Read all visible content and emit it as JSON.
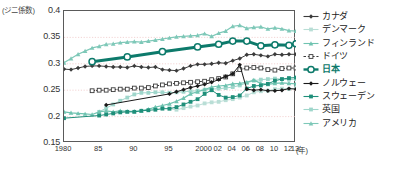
{
  "axis": {
    "y_unit_label": "(ジニ係数)",
    "y_ticks": [
      "0.4",
      "0.35",
      "0.3",
      "0.25",
      "0.2",
      "0.15"
    ],
    "x_ticks": [
      "1980",
      "85",
      "90",
      "95",
      "2000",
      "02",
      "04",
      "06",
      "08",
      "10",
      "12",
      "13"
    ],
    "x_unit_label": "(年)"
  },
  "legend": {
    "items": [
      {
        "label": "カナダ",
        "color": "#3b3b3b",
        "marker": "diamond",
        "key": "canada"
      },
      {
        "label": "デンマーク",
        "color": "#b9ded6",
        "marker": "square",
        "key": "denmark"
      },
      {
        "label": "フィンランド",
        "color": "#6fc3b0",
        "marker": "triangle",
        "key": "finland"
      },
      {
        "label": "ドイツ",
        "color": "#3b3b3b",
        "marker": "open-square",
        "key": "germany"
      },
      {
        "label": "日本",
        "color": "#0d7a6b",
        "marker": "open-circle",
        "key": "japan"
      },
      {
        "label": "ノルウェー",
        "color": "#1a1a1a",
        "marker": "diamond",
        "key": "norway"
      },
      {
        "label": "スウェーデン",
        "color": "#1f8f7a",
        "marker": "square",
        "key": "sweden"
      },
      {
        "label": "英国",
        "color": "#9fd6cb",
        "marker": "square",
        "key": "uk"
      },
      {
        "label": "アメリカ",
        "color": "#7ec8b8",
        "marker": "triangle",
        "key": "usa"
      }
    ]
  },
  "chart_data": {
    "type": "line",
    "title": "",
    "xlabel": "(年)",
    "ylabel": "(ジニ係数)",
    "ylim": [
      0.15,
      0.4
    ],
    "xlim": [
      1980,
      2013
    ],
    "grid": true,
    "grid_color": "#f0c9c9",
    "legend_position": "right",
    "x": [
      1980,
      1981,
      1982,
      1983,
      1984,
      1985,
      1986,
      1987,
      1988,
      1989,
      1990,
      1991,
      1992,
      1993,
      1994,
      1995,
      1996,
      1997,
      1998,
      1999,
      2000,
      2001,
      2002,
      2003,
      2004,
      2005,
      2006,
      2007,
      2008,
      2009,
      2010,
      2011,
      2012,
      2013
    ],
    "series": [
      {
        "name": "カナダ",
        "color": "#3b3b3b",
        "marker": "diamond",
        "width": 1,
        "values": [
          0.29,
          0.289,
          0.292,
          0.295,
          0.296,
          0.296,
          0.295,
          0.294,
          0.294,
          0.293,
          0.296,
          0.294,
          0.293,
          0.294,
          0.289,
          0.288,
          0.287,
          0.291,
          0.296,
          0.299,
          0.299,
          0.3,
          0.302,
          0.301,
          0.306,
          0.31,
          0.317,
          0.318,
          0.316,
          0.314,
          0.318,
          0.317,
          0.318,
          0.318
        ]
      },
      {
        "name": "デンマーク",
        "color": "#b9ded6",
        "marker": "square",
        "width": 1,
        "values": [
          null,
          null,
          null,
          null,
          null,
          null,
          null,
          null,
          null,
          null,
          null,
          null,
          null,
          null,
          null,
          0.215,
          0.213,
          0.216,
          0.219,
          0.221,
          0.225,
          0.227,
          0.228,
          0.231,
          0.233,
          0.236,
          0.24,
          0.246,
          0.248,
          0.249,
          0.252,
          0.253,
          0.252,
          0.254
        ]
      },
      {
        "name": "フィンランド",
        "color": "#6fc3b0",
        "marker": "triangle",
        "width": 1.2,
        "values": [
          0.209,
          0.207,
          0.206,
          0.205,
          0.204,
          0.209,
          0.211,
          0.209,
          0.211,
          0.21,
          0.21,
          0.211,
          0.214,
          0.218,
          0.221,
          0.224,
          0.229,
          0.235,
          0.243,
          0.247,
          0.251,
          0.256,
          0.258,
          0.259,
          0.262,
          0.263,
          0.265,
          0.269,
          0.263,
          0.261,
          0.263,
          0.264,
          0.263,
          0.262
        ]
      },
      {
        "name": "ドイツ",
        "color": "#3b3b3b",
        "marker": "open-square",
        "width": 1,
        "values": [
          null,
          null,
          null,
          null,
          0.249,
          0.25,
          0.25,
          0.251,
          0.252,
          0.252,
          0.254,
          0.254,
          0.255,
          0.258,
          0.26,
          0.262,
          0.263,
          0.264,
          0.265,
          0.266,
          0.267,
          0.27,
          0.272,
          0.275,
          0.281,
          0.289,
          0.292,
          0.293,
          0.292,
          0.289,
          0.288,
          0.291,
          0.292,
          0.292
        ]
      },
      {
        "name": "日本",
        "color": "#0d7a6b",
        "marker": "open-circle",
        "width": 3,
        "values": [
          null,
          null,
          null,
          null,
          0.304,
          null,
          null,
          null,
          null,
          0.313,
          null,
          null,
          null,
          null,
          0.323,
          null,
          null,
          null,
          null,
          0.332,
          null,
          null,
          0.337,
          null,
          0.343,
          null,
          0.343,
          null,
          0.334,
          null,
          0.336,
          null,
          0.335,
          0.338
        ]
      },
      {
        "name": "ノルウェー",
        "color": "#1a1a1a",
        "marker": "diamond",
        "width": 1,
        "values": [
          null,
          null,
          null,
          null,
          null,
          null,
          0.222,
          null,
          null,
          null,
          null,
          null,
          null,
          null,
          null,
          0.243,
          0.247,
          0.251,
          0.255,
          0.258,
          0.261,
          0.265,
          0.27,
          0.276,
          0.281,
          0.298,
          0.252,
          0.25,
          0.251,
          0.249,
          0.249,
          0.25,
          0.253,
          0.252
        ]
      },
      {
        "name": "スウェーデン",
        "color": "#1f8f7a",
        "marker": "square",
        "width": 1,
        "values": [
          0.197,
          null,
          null,
          null,
          null,
          0.202,
          0.204,
          0.206,
          0.208,
          0.209,
          0.209,
          0.211,
          0.212,
          0.213,
          0.215,
          0.215,
          0.218,
          0.223,
          0.228,
          0.233,
          0.243,
          0.25,
          0.241,
          0.236,
          0.237,
          0.24,
          0.253,
          0.258,
          0.259,
          0.262,
          0.268,
          0.271,
          0.273,
          0.274
        ]
      },
      {
        "name": "英国",
        "color": "#9fd6cb",
        "marker": "square",
        "width": 1,
        "values": [
          null,
          null,
          null,
          null,
          null,
          0.209,
          0.216,
          0.223,
          0.23,
          0.236,
          0.242,
          0.245,
          0.245,
          0.246,
          0.246,
          0.245,
          0.246,
          0.247,
          0.248,
          0.249,
          0.251,
          0.252,
          0.253,
          0.254,
          0.256,
          0.259,
          0.264,
          0.268,
          0.27,
          0.271,
          0.272,
          0.271,
          0.27,
          0.271
        ]
      },
      {
        "name": "アメリカ",
        "color": "#7ec8b8",
        "marker": "triangle",
        "width": 1.2,
        "values": [
          0.302,
          0.31,
          0.318,
          0.324,
          0.33,
          0.333,
          0.337,
          0.338,
          0.34,
          0.341,
          0.342,
          0.341,
          0.343,
          0.345,
          0.347,
          0.349,
          0.351,
          0.352,
          0.353,
          0.354,
          0.357,
          0.352,
          0.358,
          0.362,
          0.371,
          0.373,
          0.367,
          0.369,
          0.37,
          0.366,
          0.368,
          0.366,
          0.363,
          0.362
        ]
      }
    ]
  }
}
